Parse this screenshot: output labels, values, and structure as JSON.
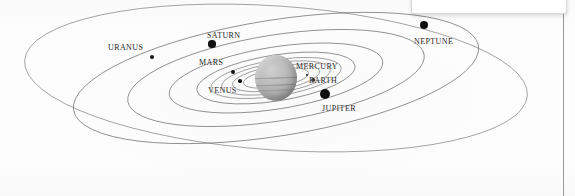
{
  "diagram": {
    "center_body": {
      "name": "Sun",
      "label": "",
      "color": "#aaaaaa"
    },
    "line_color": "#6b6b6b",
    "dot_color": "#111111",
    "label_color": "#262626"
  },
  "planets": [
    {
      "label": "MERCURY",
      "label_x": 296,
      "label_y": 62,
      "dot_x": 307,
      "dot_y": 75,
      "dot_r": 1.4,
      "orbit_rx": 33,
      "orbit_ry": 9
    },
    {
      "label": "VENUS",
      "label_x": 208,
      "label_y": 86,
      "dot_x": 240,
      "dot_y": 81,
      "dot_r": 1.8,
      "orbit_rx": 44,
      "orbit_ry": 12
    },
    {
      "label": "EARTH",
      "label_x": 309,
      "label_y": 76,
      "dot_x": 313,
      "dot_y": 80,
      "dot_r": 1.9,
      "orbit_rx": 55,
      "orbit_ry": 15
    },
    {
      "label": "MARS",
      "label_x": 199,
      "label_y": 58,
      "dot_x": 233,
      "dot_y": 72,
      "dot_r": 2.1,
      "orbit_rx": 66,
      "orbit_ry": 18
    },
    {
      "label": "JUPITER",
      "label_x": 322,
      "label_y": 104,
      "dot_x": 325,
      "dot_y": 94,
      "dot_r": 5.0,
      "orbit_rx": 80,
      "orbit_ry": 23
    },
    {
      "label": "SATURN",
      "label_x": 207,
      "label_y": 31,
      "dot_x": 212,
      "dot_y": 44,
      "dot_r": 3.6,
      "orbit_rx": 108,
      "orbit_ry": 31
    },
    {
      "label": "URANUS",
      "label_x": 108,
      "label_y": 43,
      "dot_x": 152,
      "dot_y": 57,
      "dot_r": 2.4,
      "orbit_rx": 150,
      "orbit_ry": 43
    },
    {
      "label": "NEPTUNE",
      "label_x": 414,
      "label_y": 37,
      "dot_x": 424,
      "dot_y": 25,
      "dot_r": 4.0,
      "orbit_rx": 205,
      "orbit_ry": 58
    }
  ],
  "panel": {
    "text": ""
  },
  "chart_data": {
    "type": "scatter",
    "xlabel": "",
    "ylabel": "",
    "categories": [
      "MERCURY",
      "VENUS",
      "EARTH",
      "MARS",
      "JUPITER",
      "SATURN",
      "URANUS",
      "NEPTUNE"
    ],
    "series": [
      {
        "name": "orbit semi-major (px)",
        "values": [
          33,
          44,
          55,
          66,
          80,
          108,
          150,
          205
        ]
      },
      {
        "name": "orbit semi-minor (px)",
        "values": [
          9,
          12,
          15,
          18,
          23,
          31,
          43,
          58
        ]
      },
      {
        "name": "marker radius (px)",
        "values": [
          1.4,
          1.8,
          1.9,
          2.1,
          5.0,
          3.6,
          2.4,
          4.0
        ]
      }
    ],
    "annotations": [
      "MERCURY",
      "VENUS",
      "EARTH",
      "MARS",
      "JUPITER",
      "SATURN",
      "URANUS",
      "NEPTUNE"
    ],
    "legend": "none",
    "grid": false
  }
}
